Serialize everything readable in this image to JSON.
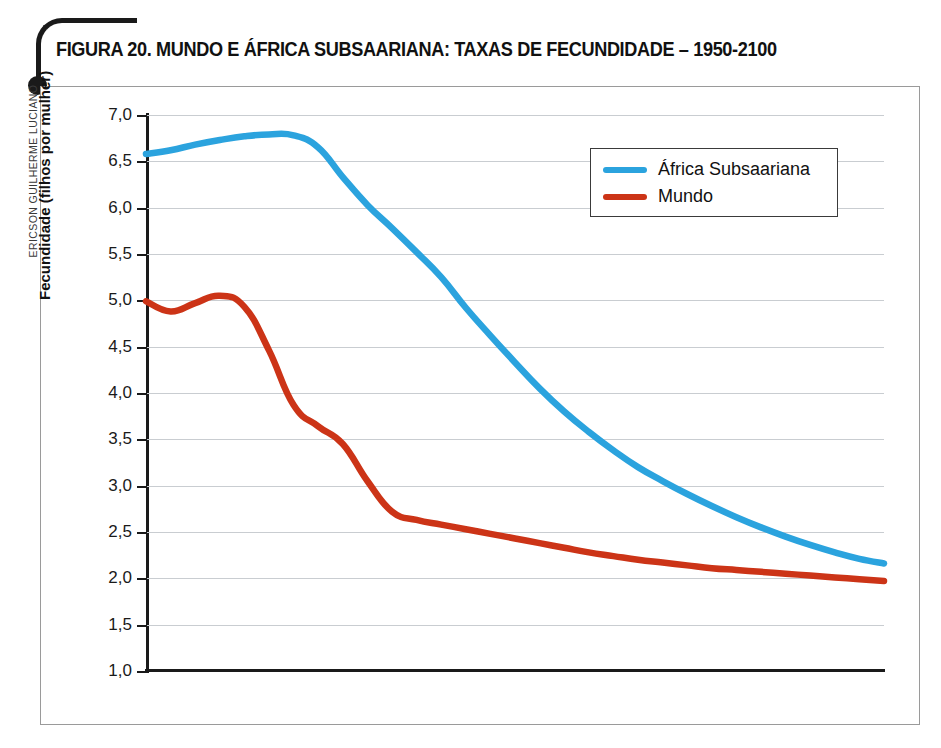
{
  "credit": "ERICSON GUILHERME LUCIANO",
  "title": "FIGURA 20. MUNDO E ÁFRICA SUBSAARIANA: TAXAS DE FECUNDIDADE – 1950-2100",
  "colors": {
    "africa": "#2ba3de",
    "mundo": "#cc3417",
    "grid": "#c9cdd1",
    "axis": "#1a1a1a",
    "frame": "#9a9a9a"
  },
  "legend": {
    "position": "inside-top-right",
    "entries": [
      {
        "label": "África Subsaariana",
        "color": "#2ba3de"
      },
      {
        "label": "Mundo",
        "color": "#cc3417"
      }
    ]
  },
  "chart_data": {
    "type": "line",
    "title": "FIGURA 20. MUNDO E ÁFRICA SUBSAARIANA: TAXAS DE FECUNDIDADE – 1950-2100",
    "xlabel": "",
    "ylabel": "Fecundidade (filhos por mulher)",
    "xlim": [
      1950,
      2100
    ],
    "ylim": [
      1.0,
      7.0
    ],
    "grid": true,
    "xticks": [
      1950,
      2000,
      2050,
      2100
    ],
    "xtick_labels": [
      "1950",
      "2000",
      "2050",
      "2100"
    ],
    "yticks": [
      1.0,
      1.5,
      2.0,
      2.5,
      3.0,
      3.5,
      4.0,
      4.5,
      5.0,
      5.5,
      6.0,
      6.5,
      7.0
    ],
    "ytick_labels": [
      "1,0",
      "1,5",
      "2,0",
      "2,5",
      "3,0",
      "3,5",
      "4,0",
      "4,5",
      "5,0",
      "5,5",
      "6,0",
      "6,5",
      "7,0"
    ],
    "x": [
      1950,
      1955,
      1960,
      1965,
      1970,
      1975,
      1980,
      1985,
      1990,
      1995,
      2000,
      2005,
      2010,
      2015,
      2020,
      2025,
      2030,
      2035,
      2040,
      2045,
      2050,
      2055,
      2060,
      2065,
      2070,
      2075,
      2080,
      2085,
      2090,
      2095,
      2100
    ],
    "series": [
      {
        "name": "África Subsaariana",
        "color": "#2ba3de",
        "values": [
          6.58,
          6.62,
          6.68,
          6.73,
          6.77,
          6.79,
          6.78,
          6.65,
          6.33,
          6.03,
          5.78,
          5.52,
          5.25,
          4.92,
          4.62,
          4.33,
          4.05,
          3.8,
          3.58,
          3.38,
          3.2,
          3.05,
          2.91,
          2.78,
          2.66,
          2.55,
          2.45,
          2.36,
          2.28,
          2.21,
          2.16
        ]
      },
      {
        "name": "Mundo",
        "color": "#cc3417",
        "values": [
          4.99,
          4.88,
          4.97,
          5.05,
          4.93,
          4.46,
          3.87,
          3.64,
          3.45,
          3.05,
          2.72,
          2.63,
          2.58,
          2.53,
          2.48,
          2.43,
          2.38,
          2.33,
          2.28,
          2.24,
          2.2,
          2.17,
          2.14,
          2.11,
          2.09,
          2.07,
          2.05,
          2.03,
          2.01,
          1.99,
          1.97
        ]
      }
    ]
  }
}
